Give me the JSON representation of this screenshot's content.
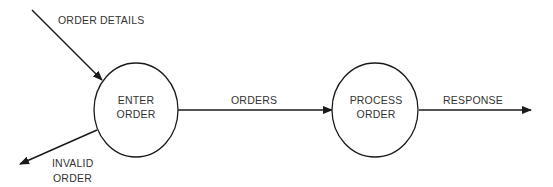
{
  "diagram": {
    "type": "data-flow-diagram",
    "colors": {
      "stroke": "#1a1a1a",
      "text": "#333333",
      "background": "#ffffff"
    },
    "nodes": [
      {
        "id": "enter_order",
        "shape": "circle",
        "label_lines": [
          "ENTER",
          "ORDER"
        ]
      },
      {
        "id": "process_order",
        "shape": "circle",
        "label_lines": [
          "PROCESS",
          "ORDER"
        ]
      }
    ],
    "edges": [
      {
        "id": "order_details",
        "from": "external",
        "to": "enter_order",
        "label": "ORDER DETAILS"
      },
      {
        "id": "invalid_order",
        "from": "enter_order",
        "to": "external",
        "label_lines": [
          "INVALID",
          "ORDER"
        ]
      },
      {
        "id": "orders",
        "from": "enter_order",
        "to": "process_order",
        "label": "ORDERS"
      },
      {
        "id": "response",
        "from": "process_order",
        "to": "external",
        "label": "RESPONSE"
      }
    ]
  }
}
